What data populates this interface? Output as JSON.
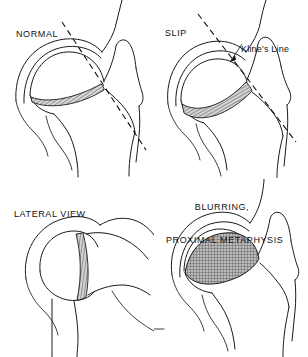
{
  "figure": {
    "background_color": "#ffffff",
    "line_color": "#1a1a1a",
    "shading_color": "#8a8a8a"
  },
  "panels": [
    {
      "id": "normal",
      "label": "NORMAL",
      "view": "anteroposterior",
      "description": "Normal hip with Klein's line intersecting the femoral head epiphysis",
      "physis": "thin hatched crescent growth plate",
      "kline_line": true
    },
    {
      "id": "slip",
      "label": "SLIP",
      "view": "anteroposterior",
      "description": "Slipped capital femoral epiphysis; Klein's line passes above the femoral head",
      "physis": "widened hatched growth plate",
      "kline_line": true,
      "annotation": {
        "label": "Kline's Line",
        "icon": "leader-arrow"
      }
    },
    {
      "id": "lateral",
      "label": "LATERAL VIEW",
      "view": "lateral",
      "description": "Lateral projection of the proximal femur showing posterior slip",
      "physis": "narrow vertical hatched growth plate",
      "kline_line": false
    },
    {
      "id": "blurring",
      "label_line1": "BLURRING,",
      "label_line2": "PROXIMAL METAPHYSIS",
      "view": "anteroposterior",
      "description": "Blurring and sclerosis of the proximal femoral metaphysis",
      "physis": "large cross-hatched shaded metaphyseal crescent",
      "kline_line": false
    }
  ]
}
